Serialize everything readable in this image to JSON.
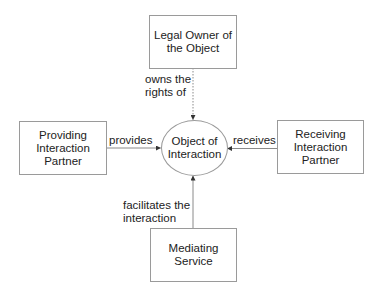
{
  "diagram": {
    "center": {
      "id": "object",
      "lines": [
        "Object of",
        "Interaction"
      ],
      "shape": "ellipse"
    },
    "nodes": {
      "owner": {
        "lines": [
          "Legal Owner of",
          "the Object"
        ]
      },
      "provider": {
        "lines": [
          "Providing",
          "Interaction",
          "Partner"
        ]
      },
      "receiver": {
        "lines": [
          "Receiving",
          "Interaction",
          "Partner"
        ]
      },
      "mediator": {
        "lines": [
          "Mediating",
          "Service"
        ]
      }
    },
    "edges": {
      "owner_to_object": {
        "from": "owner",
        "to": "object",
        "style": "dotted",
        "lines": [
          "owns the",
          "rights of"
        ]
      },
      "provider_to_object": {
        "from": "provider",
        "to": "object",
        "style": "solid",
        "lines": [
          "provides"
        ]
      },
      "receiver_to_object": {
        "from": "receiver",
        "to": "object",
        "style": "solid",
        "lines": [
          "receives"
        ]
      },
      "mediator_to_object": {
        "from": "mediator",
        "to": "object",
        "style": "solid",
        "lines": [
          "facilitates the",
          "interaction"
        ]
      }
    },
    "colors": {
      "stroke": "#9a9a9a",
      "text": "#222222",
      "background": "#ffffff"
    }
  }
}
